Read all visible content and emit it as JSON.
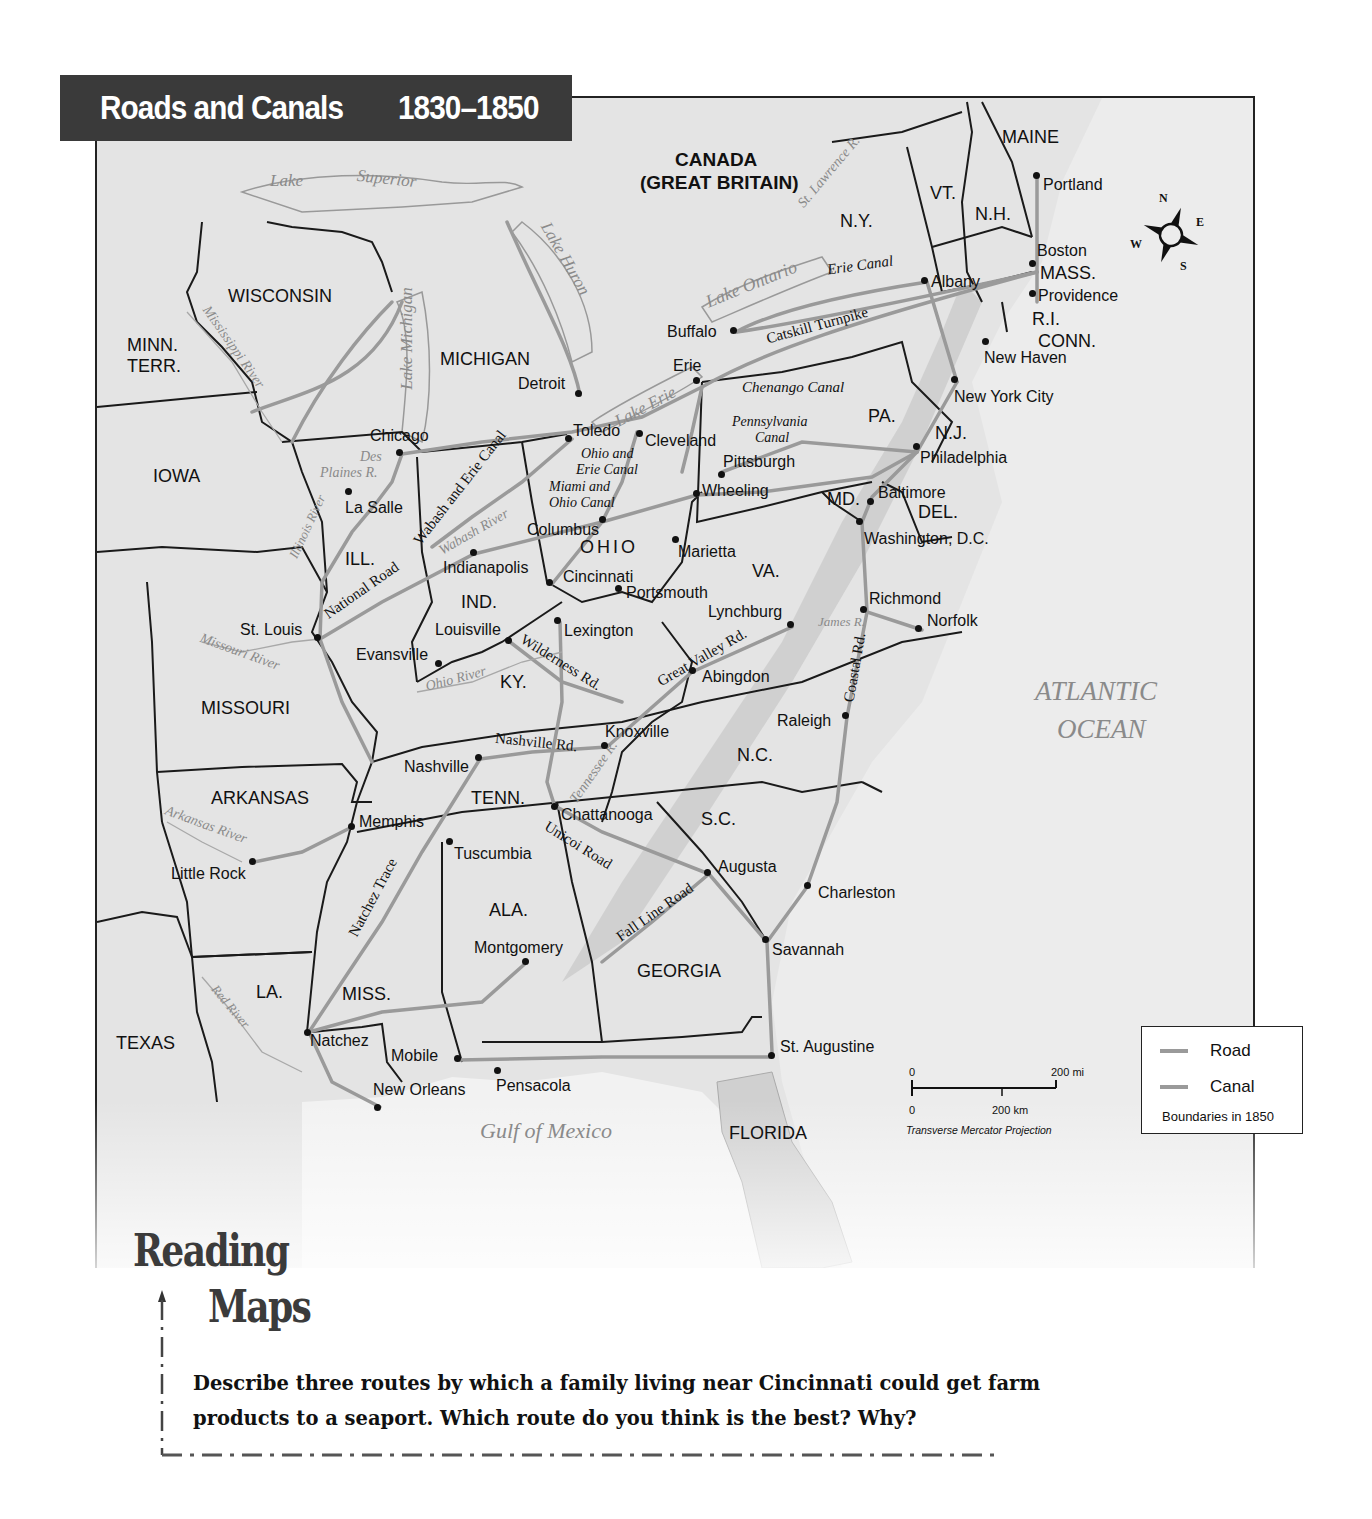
{
  "title": {
    "main": "Roads and Canals",
    "years": "1830–1850"
  },
  "regions": {
    "canada": "CANADA",
    "canada_sub": "(GREAT BRITAIN)",
    "maine": "MAINE",
    "vt": "VT.",
    "nh": "N.H.",
    "ny": "N.Y.",
    "mass": "MASS.",
    "ri": "R.I.",
    "conn": "CONN.",
    "pa": "PA.",
    "nj": "N.J.",
    "md": "MD.",
    "del": "DEL.",
    "va": "VA.",
    "nc": "N.C.",
    "sc": "S.C.",
    "georgia": "GEORGIA",
    "florida": "FLORIDA",
    "ala": "ALA.",
    "miss": "MISS.",
    "la": "LA.",
    "texas": "TEXAS",
    "arkansas": "ARKANSAS",
    "missouri": "MISSOURI",
    "tenn": "TENN.",
    "ky": "KY.",
    "ohio": "OHIO",
    "ind": "IND.",
    "ill": "ILL.",
    "iowa": "IOWA",
    "minn": "MINN.",
    "minn_sub": "TERR.",
    "wisconsin": "WISCONSIN",
    "michigan": "MICHIGAN"
  },
  "water": {
    "lake_superior_1": "Lake",
    "lake_superior_2": "Superior",
    "lake_michigan": "Lake Michigan",
    "lake_huron": "Lake Huron",
    "lake_ontario": "Lake Ontario",
    "lake_erie": "Lake Erie",
    "st_lawrence": "St. Lawrence R.",
    "mississippi": "Mississippi River",
    "des_plaines_1": "Des",
    "des_plaines_2": "Plaines R.",
    "illinois": "Illinois River",
    "wabash": "Wabash River",
    "missouri": "Missouri River",
    "ohio": "Ohio River",
    "tennessee": "Tennessee R.",
    "arkansas": "Arkansas River",
    "red": "Red River",
    "james": "James R.",
    "atlantic_1": "ATLANTIC",
    "atlantic_2": "OCEAN",
    "gulf": "Gulf of Mexico"
  },
  "routes": {
    "erie_canal": "Erie Canal",
    "catskill": "Catskill Turnpike",
    "chenango": "Chenango Canal",
    "pennsylvania_1": "Pennsylvania",
    "pennsylvania_2": "Canal",
    "ohio_erie_1": "Ohio and",
    "ohio_erie_2": "Erie Canal",
    "miami_ohio_1": "Miami and",
    "miami_ohio_2": "Ohio Canal",
    "wabash_erie": "Wabash and Erie Canal",
    "national_road": "National Road",
    "wilderness": "Wilderness Rd.",
    "great_valley": "Great Valley Rd.",
    "nashville_rd": "Nashville Rd.",
    "coastal_rd": "Coastal Rd.",
    "unicoi": "Unicoi Road",
    "fall_line": "Fall Line Road",
    "natchez_trace": "Natchez Trace"
  },
  "cities": {
    "portland": "Portland",
    "boston": "Boston",
    "providence": "Providence",
    "new_haven": "New Haven",
    "albany": "Albany",
    "buffalo": "Buffalo",
    "erie": "Erie",
    "new_york": "New York City",
    "philadelphia": "Philadelphia",
    "baltimore": "Baltimore",
    "washington": "Washington, D.C.",
    "richmond": "Richmond",
    "norfolk": "Norfolk",
    "lynchburg": "Lynchburg",
    "abingdon": "Abingdon",
    "raleigh": "Raleigh",
    "pittsburgh": "Pittsburgh",
    "wheeling": "Wheeling",
    "cleveland": "Cleveland",
    "toledo": "Toledo",
    "detroit": "Detroit",
    "chicago": "Chicago",
    "la_salle": "La Salle",
    "columbus": "Columbus",
    "marietta": "Marietta",
    "cincinnati": "Cincinnati",
    "portsmouth": "Portsmouth",
    "indianapolis": "Indianapolis",
    "louisville": "Louisville",
    "lexington": "Lexington",
    "evansville": "Evansville",
    "st_louis": "St. Louis",
    "knoxville": "Knoxville",
    "nashville": "Nashville",
    "chattanooga": "Chattanooga",
    "memphis": "Memphis",
    "little_rock": "Little Rock",
    "tuscumbia": "Tuscumbia",
    "augusta": "Augusta",
    "charleston": "Charleston",
    "savannah": "Savannah",
    "montgomery": "Montgomery",
    "natchez": "Natchez",
    "mobile": "Mobile",
    "new_orleans": "New Orleans",
    "pensacola": "Pensacola",
    "st_augustine": "St. Augustine"
  },
  "legend": {
    "road": "Road",
    "canal": "Canal",
    "note": "Boundaries in 1850",
    "road_color": "#9a9a9a",
    "canal_color": "#9a9a9a"
  },
  "scale": {
    "zero_top": "0",
    "miles": "200 mi",
    "zero_bottom": "0",
    "km": "200 km",
    "projection": "Transverse Mercator Projection"
  },
  "compass": {
    "n": "N",
    "e": "E",
    "s": "S",
    "w": "W"
  },
  "reading_maps": {
    "line1": "Reading",
    "line2": "Maps",
    "question": "Describe three routes by which a family living near Cincinnati could get farm products to a seaport. Which route do you think is the best? Why?"
  }
}
